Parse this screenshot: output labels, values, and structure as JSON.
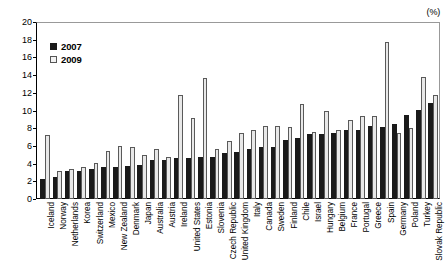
{
  "chart_data": {
    "type": "bar",
    "title": "",
    "subtitle": "",
    "xlabel": "",
    "ylabel": "",
    "unit_label": "(%)",
    "ylim": [
      0,
      20
    ],
    "ytick_step": 2,
    "yticks": [
      0,
      2,
      4,
      6,
      8,
      10,
      12,
      14,
      16,
      18,
      20
    ],
    "grid": false,
    "legend_position": "top-left",
    "categories": [
      "Iceland",
      "Norway",
      "Netherlands",
      "Korea",
      "Switzerland",
      "Mexico",
      "New Zealand",
      "Denmark",
      "Japan",
      "Australia",
      "Austria",
      "Ireland",
      "United States",
      "Estonia",
      "Slovenia",
      "Czech Republic",
      "United Kingdom",
      "Italy",
      "Canada",
      "Sweden",
      "Finland",
      "Chile",
      "Israel",
      "Hungary",
      "Belgium",
      "France",
      "Portugal",
      "Greece",
      "Spain",
      "Germany",
      "Poland",
      "Turkey",
      "Slovak Republic"
    ],
    "series": [
      {
        "name": "2007",
        "color": "#1a1a1a",
        "values": [
          2.3,
          2.5,
          3.2,
          3.2,
          3.4,
          3.6,
          3.6,
          3.7,
          3.8,
          4.4,
          4.4,
          4.6,
          4.6,
          4.7,
          4.8,
          5.2,
          5.3,
          5.7,
          5.9,
          5.9,
          6.7,
          6.9,
          7.3,
          7.4,
          7.5,
          7.8,
          7.8,
          8.2,
          8.1,
          8.5,
          9.5,
          10.1,
          10.9
        ]
      },
      {
        "name": "2009",
        "color": "#e8e8e8",
        "values": [
          7.2,
          3.2,
          3.4,
          3.6,
          4.1,
          5.4,
          6.0,
          5.9,
          5.0,
          5.6,
          4.7,
          11.7,
          9.2,
          13.7,
          5.7,
          6.6,
          7.5,
          7.8,
          8.2,
          8.2,
          8.1,
          10.7,
          7.6,
          9.9,
          7.8,
          8.9,
          9.4,
          9.4,
          17.7,
          7.5,
          8.0,
          13.8,
          11.8
        ]
      }
    ]
  },
  "legend": {
    "entries": [
      {
        "label": "2007"
      },
      {
        "label": "2009"
      }
    ]
  }
}
